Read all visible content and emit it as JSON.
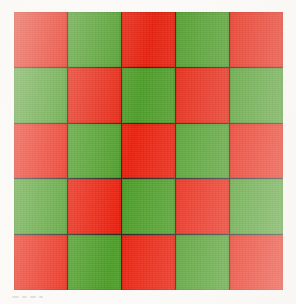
{
  "image": {
    "title": "Red and green checkerboard",
    "width": 296,
    "height": 304,
    "background_color": "#fbfaf8"
  },
  "board": {
    "name": "checkerboard",
    "rows": 5,
    "columns": 5,
    "cell_count": 25,
    "grid_left": 14,
    "grid_top": 12,
    "grid_width": 269,
    "grid_height": 278,
    "seam_color": "#2b2b22",
    "seam_width_px": 1,
    "colors": {
      "red": "#ee2411",
      "green": "#51a22c"
    },
    "color_names": {
      "red": "red",
      "green": "green"
    },
    "pattern_start": "red",
    "cells": [
      [
        "red",
        "green",
        "red",
        "green",
        "red"
      ],
      [
        "green",
        "red",
        "green",
        "red",
        "green"
      ],
      [
        "red",
        "green",
        "red",
        "green",
        "red"
      ],
      [
        "green",
        "red",
        "green",
        "red",
        "green"
      ],
      [
        "red",
        "green",
        "red",
        "green",
        "red"
      ]
    ],
    "counts": {
      "red": 13,
      "green": 12
    }
  },
  "artifact": {
    "name": "bottom-left-scan-marks",
    "description": "faint illegible gray marks",
    "color": "#b9b6b0"
  }
}
